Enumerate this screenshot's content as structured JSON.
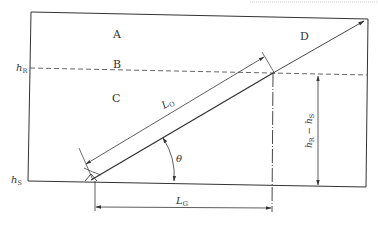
{
  "diagram": {
    "regions": {
      "a": "A",
      "b": "B",
      "c": "C",
      "d": "D"
    },
    "levels": {
      "h_r": {
        "main": "h",
        "sub": "R"
      },
      "h_s": {
        "main": "h",
        "sub": "S"
      }
    },
    "dimensions": {
      "l_o": {
        "main": "L",
        "sub": "O"
      },
      "l_g": {
        "main": "L",
        "sub": "G"
      },
      "height_diff": {
        "main1": "h",
        "sub1": "R",
        "minus": " − ",
        "main2": "h",
        "sub2": "S"
      },
      "angle": "θ"
    },
    "colors": {
      "line": "#333333",
      "dashed": "#555555",
      "top_dotted": "#bbbbbb"
    }
  }
}
